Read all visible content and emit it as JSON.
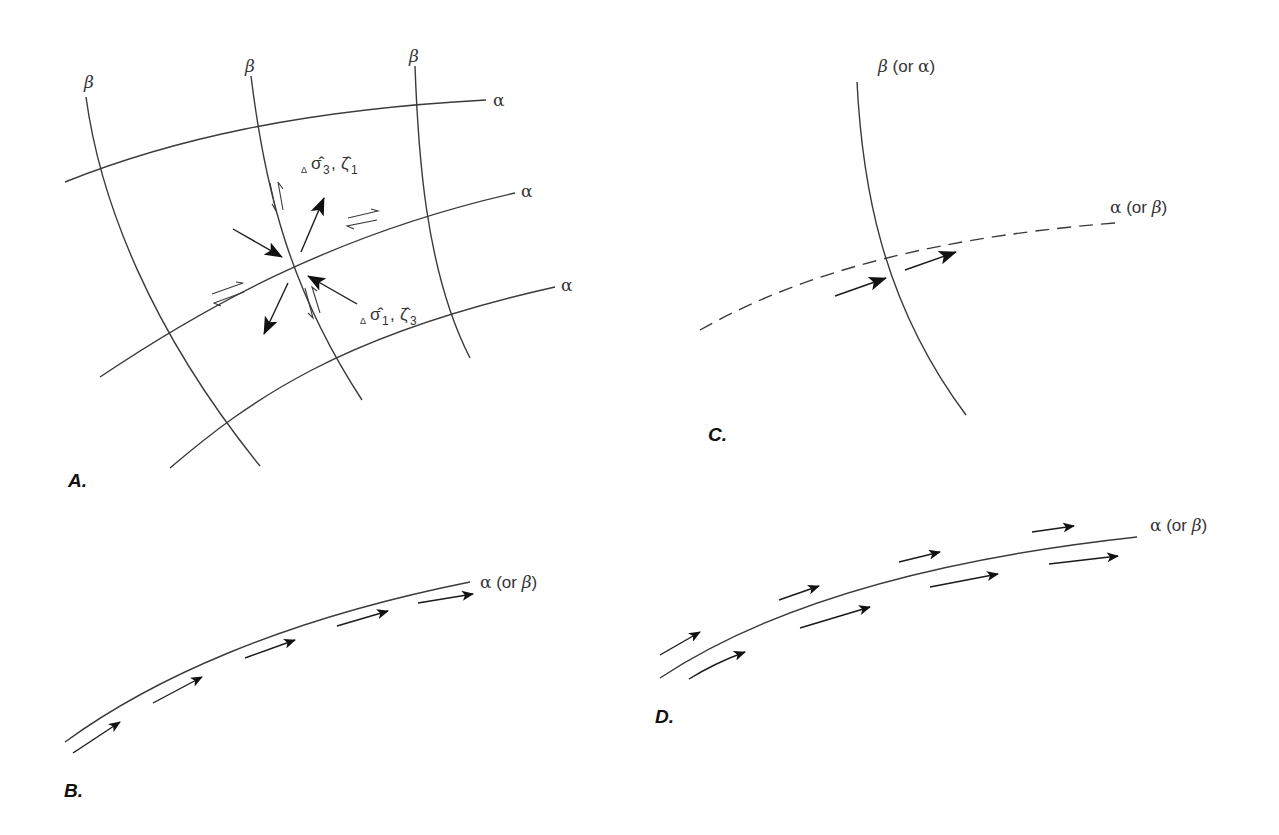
{
  "figure": {
    "panels": [
      {
        "id": "A",
        "label": "A.",
        "beta_labels": [
          "β",
          "β",
          "β"
        ],
        "alpha_labels": [
          "α",
          "α",
          "α"
        ],
        "stress_label_top": {
          "delta": "Δ",
          "sigma": "σ̂",
          "sigma_sub": "3",
          "sep": ",",
          "zeta": "ζ̂",
          "zeta_sub": "1"
        },
        "stress_label_bottom": {
          "delta": "Δ",
          "sigma": "σ̂",
          "sigma_sub": "1",
          "sep": ",",
          "zeta": "ζ̂",
          "zeta_sub": "3"
        }
      },
      {
        "id": "B",
        "label": "B.",
        "curve_label": {
          "greek": "α",
          "rest": " (or ",
          "alt": "β",
          "close": ")"
        }
      },
      {
        "id": "C",
        "label": "C.",
        "solid_label": {
          "greek": "β",
          "rest": " (or ",
          "alt": "α",
          "close": ")"
        },
        "dashed_label": {
          "greek": "α",
          "rest": " (or ",
          "alt": "β",
          "close": ")"
        }
      },
      {
        "id": "D",
        "label": "D.",
        "curve_label": {
          "greek": "α",
          "rest": " (or ",
          "alt": "β",
          "close": ")"
        }
      }
    ],
    "colors": {
      "line": "#3a3a3a",
      "arrow": "#111111",
      "background": "#ffffff"
    }
  }
}
